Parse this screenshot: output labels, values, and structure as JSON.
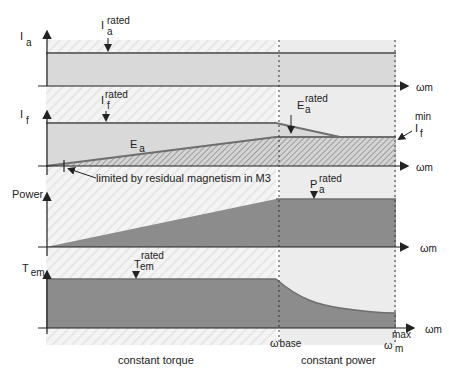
{
  "colors": {
    "hatch_bg": "#e6e6e6",
    "light_fill": "#d9d9d9",
    "constant_power_bg": "#ececec",
    "dark_fill": "#8c8c8c",
    "line": "#6e6e6e",
    "axis": "#222222"
  },
  "axes": {
    "x_label": "ω",
    "x_sub": "m"
  },
  "panel_ia": {
    "y_label": "I",
    "y_sub": "a",
    "annot_main": "I",
    "annot_sup": "rated",
    "annot_sub": "a"
  },
  "panel_if": {
    "y_label": "I",
    "y_sub": "f",
    "annot_if_main": "I",
    "annot_if_sup": "rated",
    "annot_if_sub": "f",
    "ea_label": "E",
    "ea_sub": "a",
    "ea_rated_main": "E",
    "ea_rated_sup": "rated",
    "ea_rated_sub": "a",
    "if_min_main": "I",
    "if_min_sup": "min",
    "if_min_sub": "f",
    "residual_note": "limited by residual magnetism in M3"
  },
  "panel_power": {
    "y_label": "Power",
    "annot_main": "P",
    "annot_sup": "rated",
    "annot_sub": "a"
  },
  "panel_tem": {
    "y_label": "T",
    "y_sub": "em",
    "annot_main": "T",
    "annot_sup": "rated",
    "annot_sub": "em"
  },
  "markers": {
    "base_main": "ω",
    "base_sub": "base",
    "max_main": "ω",
    "max_sup": "max",
    "max_sub": "m"
  },
  "regions": {
    "constant_torque": "constant torque",
    "constant_power": "constant power"
  }
}
